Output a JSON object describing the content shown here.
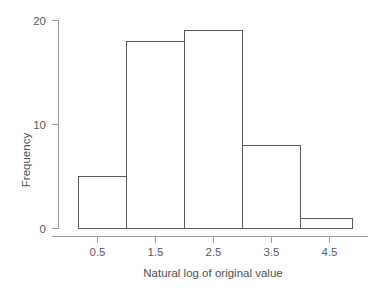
{
  "chart_data": {
    "type": "bar",
    "title": "",
    "subtitle": "",
    "xlabel": "Natural log of original value",
    "ylabel": "Frequency",
    "categories": [
      "0-1",
      "1-2",
      "2-3",
      "3-4",
      "4-5"
    ],
    "values": [
      5,
      18,
      19,
      8,
      1
    ],
    "bin_edges": [
      0.17,
      1.0,
      2.0,
      3.0,
      4.0,
      4.9
    ],
    "x_ticks": [
      0.5,
      1.5,
      2.5,
      3.5,
      4.5
    ],
    "x_tick_labels": [
      "0.5",
      "1.5",
      "2.5",
      "3.5",
      "4.5"
    ],
    "y_ticks": [
      0,
      10,
      20
    ],
    "y_tick_labels": [
      "0",
      "10",
      "20"
    ],
    "xlim": [
      0.0,
      5.1
    ],
    "ylim": [
      0,
      21.5
    ],
    "grid": false,
    "legend": false,
    "legend_position": "none",
    "bar_fill_color": "#ffffff",
    "bar_edge_color": "#5a5a5a",
    "axis_color": "#9a9a9a",
    "text_color": "#5a5a5a",
    "background_color": "#ffffff"
  }
}
